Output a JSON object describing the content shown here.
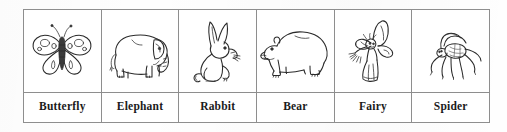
{
  "worksheet": {
    "table": {
      "columns": 6,
      "rows": [
        "picture-row",
        "label-row"
      ],
      "cells": [
        {
          "label": "Butterfly",
          "picture": "butterfly-drawing"
        },
        {
          "label": "Elephant",
          "picture": "elephant-drawing"
        },
        {
          "label": "Rabbit",
          "picture": "rabbit-drawing"
        },
        {
          "label": "Bear",
          "picture": "bear-drawing"
        },
        {
          "label": "Fairy",
          "picture": "fairy-drawing"
        },
        {
          "label": "Spider",
          "picture": "spider-drawing"
        }
      ]
    },
    "colors": {
      "ink": "#2a2a2a",
      "border": "#8e8e8e",
      "paper": "#ffffff",
      "page_background": "#fefefe"
    }
  }
}
